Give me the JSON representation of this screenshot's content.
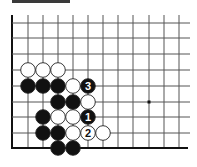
{
  "diagram": {
    "type": "go-board-diagram",
    "header_bar": true,
    "grid": {
      "columns_x": [
        12,
        28,
        43,
        58,
        73,
        88,
        103,
        118,
        133,
        149,
        164,
        179
      ],
      "rows_y": [
        23,
        38,
        54,
        70,
        86,
        102,
        117,
        133,
        148
      ],
      "right_extent": 190,
      "top_extent": 15,
      "left_edge_thick": true,
      "bottom_edge_thick": true
    },
    "star_points": [
      {
        "col": 9,
        "row": 5
      }
    ],
    "stones": [
      {
        "col": 1,
        "row": 3,
        "color": "white",
        "label": ""
      },
      {
        "col": 2,
        "row": 3,
        "color": "white",
        "label": ""
      },
      {
        "col": 3,
        "row": 3,
        "color": "white",
        "label": ""
      },
      {
        "col": 1,
        "row": 4,
        "color": "black",
        "label": ""
      },
      {
        "col": 2,
        "row": 4,
        "color": "black",
        "label": ""
      },
      {
        "col": 3,
        "row": 4,
        "color": "black",
        "label": ""
      },
      {
        "col": 4,
        "row": 4,
        "color": "white",
        "label": ""
      },
      {
        "col": 5,
        "row": 4,
        "color": "black",
        "label": "3"
      },
      {
        "col": 3,
        "row": 5,
        "color": "black",
        "label": ""
      },
      {
        "col": 4,
        "row": 5,
        "color": "black",
        "label": ""
      },
      {
        "col": 5,
        "row": 5,
        "color": "white",
        "label": ""
      },
      {
        "col": 2,
        "row": 6,
        "color": "black",
        "label": ""
      },
      {
        "col": 3,
        "row": 6,
        "color": "white",
        "label": ""
      },
      {
        "col": 4,
        "row": 6,
        "color": "white",
        "label": ""
      },
      {
        "col": 5,
        "row": 6,
        "color": "black",
        "label": "1"
      },
      {
        "col": 2,
        "row": 7,
        "color": "black",
        "label": ""
      },
      {
        "col": 3,
        "row": 7,
        "color": "black",
        "label": ""
      },
      {
        "col": 4,
        "row": 7,
        "color": "white",
        "label": ""
      },
      {
        "col": 5,
        "row": 7,
        "color": "white",
        "label": "2"
      },
      {
        "col": 6,
        "row": 7,
        "color": "white",
        "label": ""
      },
      {
        "col": 3,
        "row": 8,
        "color": "black",
        "label": ""
      },
      {
        "col": 4,
        "row": 8,
        "color": "black",
        "label": ""
      }
    ],
    "colors": {
      "line": "#555555",
      "edge": "#111111",
      "black_stone": "#111111",
      "white_stone": "#ffffff",
      "stone_outline": "#222222",
      "bar": "#3a3a3a"
    }
  }
}
